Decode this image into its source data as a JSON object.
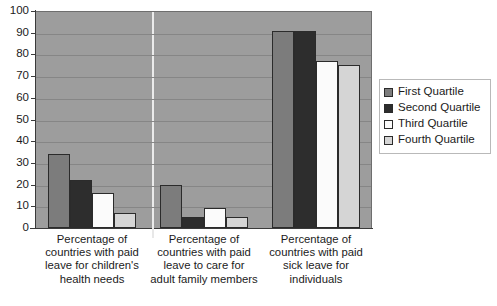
{
  "chart_data": {
    "type": "bar",
    "title": "",
    "xlabel": "",
    "ylabel": "",
    "ylim": [
      0,
      100
    ],
    "yticks": [
      0,
      10,
      20,
      30,
      40,
      50,
      60,
      70,
      80,
      90,
      100
    ],
    "grid": true,
    "legend_position": "right",
    "categories": [
      "Percentage of countries with paid leave for children's health needs",
      "Percentage of countries with paid leave to care for adult family members",
      "Percentage of countries with paid sick leave for individuals"
    ],
    "series": [
      {
        "name": "First Quartile",
        "color": "#7c7c7c",
        "values": [
          34,
          20,
          91
        ]
      },
      {
        "name": "Second Quartile",
        "color": "#2d2d2d",
        "values": [
          22,
          5,
          91
        ]
      },
      {
        "name": "Third Quartile",
        "color": "#fbfbfb",
        "values": [
          16,
          9,
          77
        ]
      },
      {
        "name": "Fourth Quartile",
        "color": "#d5d5d5",
        "values": [
          7,
          5,
          75
        ]
      }
    ]
  },
  "legend": {
    "items": [
      {
        "label": "First Quartile"
      },
      {
        "label": "Second Quartile"
      },
      {
        "label": "Third Quartile"
      },
      {
        "label": "Fourth Quartile"
      }
    ]
  }
}
